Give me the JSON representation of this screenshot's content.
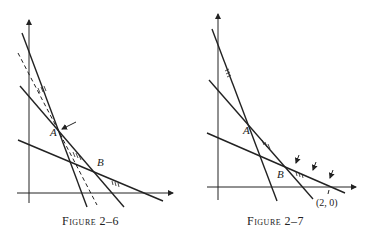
{
  "figures": [
    {
      "id": "fig-2-6",
      "caption": "Figure 2–6",
      "point_labels": {
        "A": "A",
        "B": "B"
      },
      "annotations": [
        "arrow pointing at vertex A",
        "dashed line through region",
        "hatch marks on constraint lines"
      ]
    },
    {
      "id": "fig-2-7",
      "caption": "Figure 2–7",
      "point_labels": {
        "A": "A",
        "B": "B"
      },
      "coord_label": "(2, 0)",
      "annotations": [
        "three arrows along edge from B to (2, 0)",
        "hatch marks on constraint lines"
      ]
    }
  ]
}
